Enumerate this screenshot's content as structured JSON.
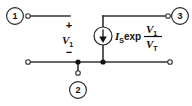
{
  "diagram": {
    "type": "circuit-schematic",
    "background_color": "#ffffff",
    "wire_color": "#333333",
    "text_color": "#111111"
  },
  "nodes": [
    {
      "id": "node-1",
      "label": "1",
      "position": "top-left"
    },
    {
      "id": "node-2",
      "label": "2",
      "position": "bottom-center"
    },
    {
      "id": "node-3",
      "label": "3",
      "position": "top-right"
    }
  ],
  "port_voltage": {
    "name": "port-voltage-v1",
    "plus_sign": "+",
    "minus_sign": "−",
    "symbol": "V",
    "subscript": "1"
  },
  "current_source": {
    "name": "dependent-current-source",
    "symbol_type": "circle-with-down-arrow",
    "direction": "down",
    "expression": {
      "saturation_symbol": "I",
      "saturation_subscript": "S",
      "function": "exp",
      "numerator_symbol": "V",
      "numerator_subscript": "1",
      "denominator_symbol": "V",
      "denominator_subscript": "T",
      "full_text": "I_S exp (V_1 / V_T)"
    }
  },
  "terminals": [
    {
      "name": "terminal-node-1",
      "label": "1"
    },
    {
      "name": "terminal-node-2",
      "label": "2"
    },
    {
      "name": "terminal-node-3",
      "label": "3"
    },
    {
      "name": "terminal-bottom-left",
      "label": ""
    },
    {
      "name": "terminal-bottom-right",
      "label": ""
    }
  ]
}
